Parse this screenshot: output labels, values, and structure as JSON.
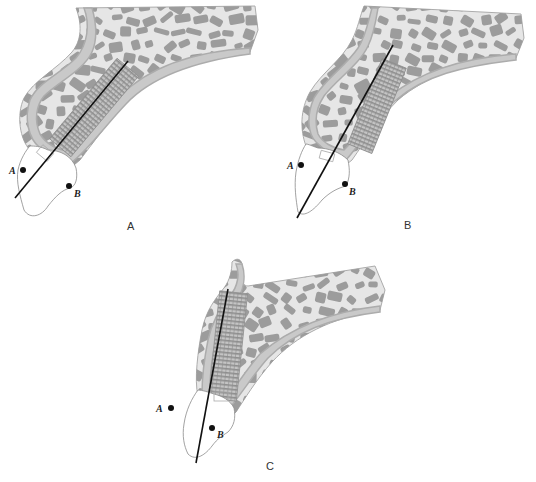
{
  "figure": {
    "panels": [
      {
        "id": "A",
        "caption": "A",
        "caption_pos": [
          127,
          220
        ],
        "origin": [
          0,
          0
        ],
        "axis_line": {
          "x1": 15,
          "y1": 198,
          "x2": 128,
          "y2": 61
        },
        "points": [
          {
            "label": "A",
            "x": 23,
            "y": 170,
            "lx": 9,
            "ly": 174
          },
          {
            "label": "B",
            "x": 69,
            "y": 186,
            "lx": 74,
            "ly": 197
          }
        ]
      },
      {
        "id": "B",
        "caption": "B",
        "caption_pos": [
          404,
          219
        ],
        "origin": [
          266,
          0
        ],
        "axis_line": {
          "x1": 297,
          "y1": 218,
          "x2": 393,
          "y2": 45
        },
        "points": [
          {
            "label": "A",
            "x": 301,
            "y": 165,
            "lx": 287,
            "ly": 169
          },
          {
            "label": "B",
            "x": 345,
            "y": 184,
            "lx": 349,
            "ly": 195
          }
        ]
      },
      {
        "id": "C",
        "caption": "C",
        "caption_pos": [
          266,
          460
        ],
        "origin": [
          140,
          240
        ],
        "axis_line": {
          "x1": 196,
          "y1": 463,
          "x2": 228,
          "y2": 289
        },
        "points": [
          {
            "label": "A",
            "x": 171,
            "y": 408,
            "lx": 156,
            "ly": 412
          },
          {
            "label": "B",
            "x": 212,
            "y": 428,
            "lx": 217,
            "ly": 438
          }
        ]
      }
    ],
    "colors": {
      "background": "#ffffff",
      "cancellous_bone": "#e6e6e6",
      "trabeculae": "#9c9c9c",
      "cortex": "#c9c9c9",
      "periosteum": "#acacac",
      "implant_dark": "#8e8e8e",
      "implant_light": "#c4c4c4",
      "tooth": "#ffffff",
      "tooth_outline": "#8a8a8a",
      "axis_line": "#111111",
      "dot": "#111111"
    }
  }
}
